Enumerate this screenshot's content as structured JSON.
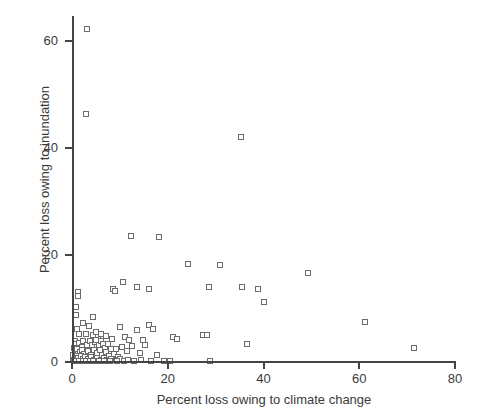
{
  "chart_data": {
    "type": "scatter",
    "title": "",
    "xlabel": "Percent loss owing to climate change",
    "ylabel": "Percent loss owing to inundation",
    "xlim": [
      0,
      80
    ],
    "ylim": [
      0,
      64.65
    ],
    "xticks": [
      0,
      20,
      40,
      60,
      80
    ],
    "yticks": [
      0,
      20,
      40,
      60
    ],
    "xtick_labels": [
      "0",
      "20",
      "40",
      "60",
      "80"
    ],
    "ytick_labels": [
      "0",
      "20",
      "40",
      "60"
    ],
    "grid": false,
    "legend": null,
    "marker": "open-square",
    "marker_edge_color": "#6b6b6b",
    "marker_face_color": "#ffffff",
    "axis_color": "#444444",
    "background_color": "#ffffff",
    "points": [
      [
        3.2,
        62.2
      ],
      [
        2.9,
        46.3
      ],
      [
        35.2,
        42.1
      ],
      [
        12.3,
        23.6
      ],
      [
        18.1,
        23.4
      ],
      [
        1.2,
        13.1
      ],
      [
        1.2,
        12.3
      ],
      [
        30.9,
        18.1
      ],
      [
        49.3,
        16.7
      ],
      [
        24.3,
        18.4
      ],
      [
        35.6,
        14.1
      ],
      [
        38.9,
        13.6
      ],
      [
        40.2,
        11.3
      ],
      [
        28.6,
        14.0
      ],
      [
        10.6,
        14.9
      ],
      [
        13.6,
        14.0
      ],
      [
        0.9,
        10.2
      ],
      [
        0.8,
        8.7
      ],
      [
        2.3,
        7.3
      ],
      [
        4.4,
        8.4
      ],
      [
        8.6,
        13.6
      ],
      [
        9.0,
        13.3
      ],
      [
        16.0,
        13.7
      ],
      [
        61.2,
        7.5
      ],
      [
        71.4,
        2.6
      ],
      [
        1.0,
        6.2
      ],
      [
        1.4,
        5.3
      ],
      [
        3.0,
        5.2
      ],
      [
        3.6,
        6.7
      ],
      [
        4.3,
        5.1
      ],
      [
        5.0,
        5.6
      ],
      [
        5.4,
        4.6
      ],
      [
        6.1,
        5.3
      ],
      [
        7.2,
        4.9
      ],
      [
        8.4,
        4.3
      ],
      [
        10.1,
        6.5
      ],
      [
        11.1,
        4.6
      ],
      [
        12.0,
        4.2
      ],
      [
        13.6,
        6.0
      ],
      [
        14.8,
        4.1
      ],
      [
        16.1,
        6.9
      ],
      [
        17.0,
        6.2
      ],
      [
        21.0,
        4.6
      ],
      [
        22.0,
        4.3
      ],
      [
        27.3,
        5.1
      ],
      [
        28.3,
        5.0
      ],
      [
        36.6,
        3.3
      ],
      [
        0.6,
        4.0
      ],
      [
        0.9,
        3.3
      ],
      [
        1.5,
        3.5
      ],
      [
        2.0,
        2.8
      ],
      [
        2.4,
        3.9
      ],
      [
        3.1,
        3.2
      ],
      [
        3.8,
        4.0
      ],
      [
        4.1,
        3.1
      ],
      [
        4.7,
        3.7
      ],
      [
        5.1,
        4.1
      ],
      [
        5.6,
        3.1
      ],
      [
        6.0,
        4.0
      ],
      [
        6.4,
        3.3
      ],
      [
        6.9,
        2.7
      ],
      [
        7.6,
        3.4
      ],
      [
        8.1,
        2.5
      ],
      [
        9.2,
        2.4
      ],
      [
        10.4,
        2.8
      ],
      [
        11.4,
        2.1
      ],
      [
        12.6,
        3.0
      ],
      [
        14.1,
        1.6
      ],
      [
        15.3,
        3.2
      ],
      [
        17.8,
        1.3
      ],
      [
        0.4,
        2.6
      ],
      [
        0.7,
        2.0
      ],
      [
        1.1,
        2.4
      ],
      [
        1.6,
        1.8
      ],
      [
        2.1,
        2.2
      ],
      [
        2.6,
        1.5
      ],
      [
        3.3,
        2.0
      ],
      [
        3.9,
        1.4
      ],
      [
        4.5,
        2.3
      ],
      [
        5.2,
        1.7
      ],
      [
        5.8,
        2.2
      ],
      [
        6.3,
        1.3
      ],
      [
        7.0,
        1.9
      ],
      [
        7.8,
        1.2
      ],
      [
        8.8,
        1.5
      ],
      [
        9.6,
        1.0
      ],
      [
        0.3,
        1.3
      ],
      [
        0.6,
        0.9
      ],
      [
        1.0,
        1.2
      ],
      [
        1.3,
        0.7
      ],
      [
        1.9,
        1.1
      ],
      [
        2.4,
        0.6
      ],
      [
        2.8,
        1.0
      ],
      [
        3.4,
        0.5
      ],
      [
        4.0,
        0.9
      ],
      [
        4.6,
        0.4
      ],
      [
        5.3,
        0.8
      ],
      [
        6.0,
        0.4
      ],
      [
        6.7,
        0.7
      ],
      [
        7.4,
        0.3
      ],
      [
        8.2,
        0.6
      ],
      [
        9.1,
        0.3
      ],
      [
        10.0,
        0.5
      ],
      [
        10.9,
        0.2
      ],
      [
        11.8,
        0.4
      ],
      [
        13.0,
        0.2
      ],
      [
        14.5,
        0.3
      ],
      [
        16.6,
        0.2
      ],
      [
        19.2,
        0.2
      ],
      [
        20.4,
        0.1
      ],
      [
        28.8,
        0.1
      ],
      [
        0.2,
        0.3
      ],
      [
        0.5,
        0.2
      ],
      [
        0.9,
        0.1
      ],
      [
        1.5,
        0.2
      ],
      [
        2.2,
        0.1
      ],
      [
        3.0,
        0.2
      ],
      [
        3.7,
        0.1
      ],
      [
        4.4,
        0.2
      ],
      [
        5.6,
        0.1
      ],
      [
        6.6,
        0.1
      ],
      [
        7.9,
        0.1
      ],
      [
        9.4,
        0.1
      ]
    ]
  }
}
